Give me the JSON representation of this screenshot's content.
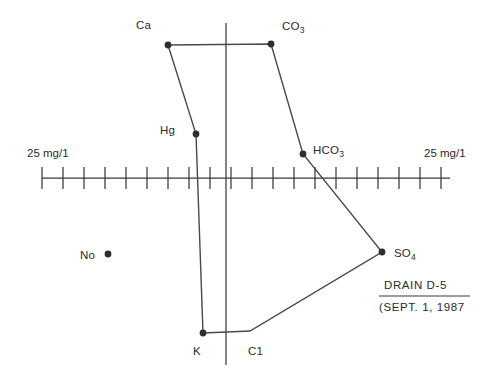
{
  "figure": {
    "type": "stiff-diagram",
    "title_caption": "DRAIN D-5",
    "date_caption": "(SEPT. 1, 1987",
    "scale_label_left": "25 mg/1",
    "scale_label_right": "25 mg/1",
    "axis": {
      "center_x": 226,
      "left_end_x": 42,
      "right_end_x": 450,
      "baseline_y": 178,
      "vertical_top_y": 23,
      "vertical_bottom_y": 365,
      "tick_spacing_px": 21,
      "tick_count": 20,
      "tick_half_height": 11
    },
    "labels": {
      "ca": "Ca",
      "co3_base": "CO",
      "co3_sub": "3",
      "hg": "Hg",
      "hco3_base": "HCO",
      "hco3_sub": "3",
      "na": "No",
      "so4_base": "SO",
      "so4_sub": "4",
      "k": "K",
      "cl": "C1"
    },
    "colors": {
      "line": "#4a4a4a",
      "axis": "#3a3a3a",
      "vertex": "#2e2e2e",
      "text": "#2b2b2b",
      "background": "#ffffff"
    }
  },
  "chart_data": {
    "type": "line",
    "title": "DRAIN D-5",
    "subtitle": "(SEPT. 1, 1987",
    "xlabel": "25 mg/1",
    "ylabel": "",
    "grid": false,
    "legend": "none",
    "axis_units": "mg/1",
    "units_per_tick": 25,
    "xlim": [
      -220,
      220
    ],
    "cations_left": [
      {
        "name": "Ca",
        "row": 1,
        "px": 168,
        "py": 45,
        "value_mg_per_l": 70
      },
      {
        "name": "Hg",
        "row": 2,
        "px": 196,
        "py": 134,
        "value_mg_per_l": 36
      },
      {
        "name": "No",
        "row": 3,
        "px": 108,
        "py": 254,
        "value_mg_per_l": 140
      },
      {
        "name": "K",
        "row": 4,
        "px": 203,
        "py": 333,
        "value_mg_per_l": 27
      }
    ],
    "anions_right": [
      {
        "name": "CO3",
        "row": 1,
        "px": 271,
        "py": 44,
        "value_mg_per_l": 54
      },
      {
        "name": "HCO3",
        "row": 2,
        "px": 303,
        "py": 154,
        "value_mg_per_l": 92
      },
      {
        "name": "SO4",
        "row": 3,
        "px": 382,
        "py": 252,
        "value_mg_per_l": 186
      },
      {
        "name": "C1",
        "row": 4,
        "px": 250,
        "py": 331,
        "value_mg_per_l": 29
      }
    ],
    "polygon_points_px": "168,45 271,44 303,154 382,252 250,331 203,333 196,134 168,45"
  }
}
